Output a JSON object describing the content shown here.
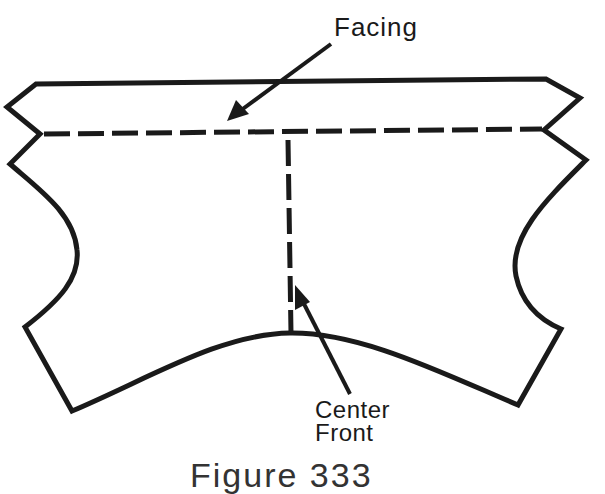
{
  "figure": {
    "labels": {
      "facing": "Facing",
      "center_front_line1": "Center",
      "center_front_line2": "Front"
    },
    "caption": "Figure 333"
  },
  "colors": {
    "ink": "#1a1a1a",
    "background": "#ffffff"
  }
}
